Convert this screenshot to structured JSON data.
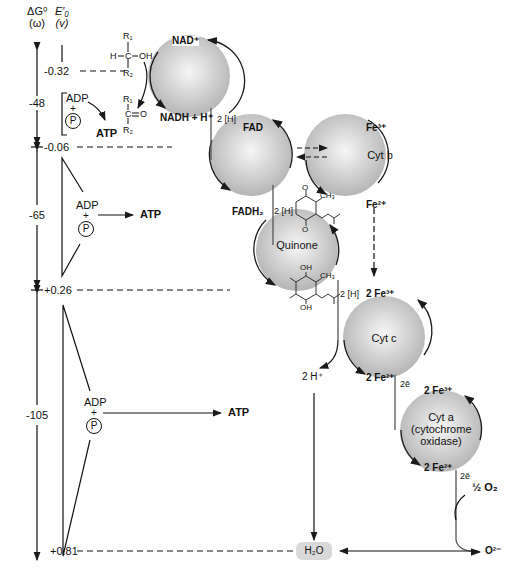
{
  "axes": {
    "dg_header": "ΔG⁰",
    "dg_unit": "(ω)",
    "e_header": "E′₀",
    "e_unit": "(v)"
  },
  "potentials": [
    {
      "value": "-0.32",
      "y": 71
    },
    {
      "value": "-0.06",
      "y": 147
    },
    {
      "value": "+0.26",
      "y": 290
    },
    {
      "value": "+0.81",
      "y": 551
    }
  ],
  "free_energy": [
    {
      "value": "-48"
    },
    {
      "value": "-65"
    },
    {
      "value": "-105"
    }
  ],
  "phosphorylation_sites": [
    {
      "adp": "ADP",
      "plus": "+",
      "p": "P",
      "atp": "ATP"
    },
    {
      "adp": "ADP",
      "plus": "+",
      "p": "P",
      "atp": "ATP"
    },
    {
      "adp": "ADP",
      "plus": "+",
      "p": "P",
      "atp": "ATP"
    }
  ],
  "substrate": {
    "alcohol": {
      "r1": "R₁",
      "h": "H",
      "c": "C",
      "oh": "OH",
      "r2": "R₂"
    },
    "carbonyl": {
      "r1": "R₁",
      "c": "C",
      "o": "O",
      "r2": "R₂"
    }
  },
  "carriers": {
    "nad": {
      "top": "NAD⁺",
      "bottom": "NADH + H⁺"
    },
    "fad": {
      "top": "FAD",
      "bottom": "FADH₂"
    },
    "cytb": {
      "label": "Cyt b",
      "top": "Fe³⁺",
      "bottom": "Fe²⁺"
    },
    "quinone": {
      "label": "Quinone",
      "ch3_top": "CH₃",
      "o_top": "O",
      "o_bottom": "O",
      "oh_top": "OH",
      "ch3_bot": "CH₃",
      "oh_bottom": "OH"
    },
    "cytc": {
      "label": "Cyt c",
      "top": "2 Fe³⁺",
      "bottom": "2 Fe²⁺"
    },
    "cyta": {
      "label_line1": "Cyt a",
      "label_line2": "(cytochrome",
      "label_line3": "oxidase)",
      "top": "2 Fe³⁺",
      "bottom": "2 Fe²⁺"
    }
  },
  "transfers": {
    "nad_to_fad": "2 [H]",
    "fad_to_quinone": "2 [H]",
    "quinone_to_cytc": "2 [H]",
    "cytc_to_cyta": "2ē",
    "cyta_to_o2": "2ē",
    "protons": "2 H⁺",
    "oxygen": "½ O₂",
    "oxide": "O²⁻",
    "water": "H₂O"
  },
  "colors": {
    "sphere_light": "#f4f4f4",
    "sphere_dark": "#b8b8b8",
    "line": "#1a1a1a",
    "water_box": "#d9d9d9"
  }
}
